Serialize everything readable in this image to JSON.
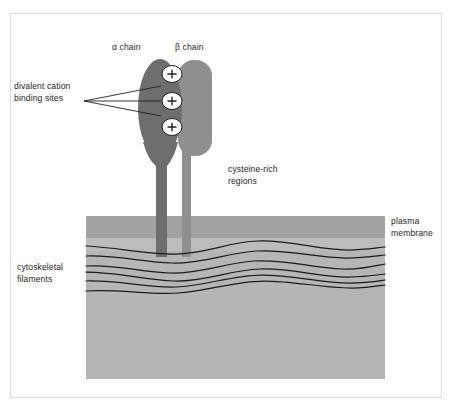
{
  "figure": {
    "frame_color": "#d8d8d8",
    "background": "#ffffff"
  },
  "labels": {
    "alpha_chain": "α chain",
    "beta_chain": "β chain",
    "divalent_cation": "divalent cation\nbinding sites",
    "cysteine_rich": "cysteine-rich\nregions",
    "plasma_membrane": "plasma\nmembrane",
    "cytoskeletal_filaments": "cytoskeletal\nfilaments"
  },
  "binding_sites": {
    "symbol": "+",
    "count": 3,
    "fill": "#ffffff",
    "stroke": "#231f20"
  },
  "colors": {
    "alpha_chain": "#6e6e6e",
    "beta_chain": "#8f8f8f",
    "alpha_stalk": "#6e6e6e",
    "beta_stalk": "#8f8f8f",
    "membrane_outer_band": "#a3a3a3",
    "membrane_inner_band": "#bcbcbc",
    "cytoplasm": "#b5b5b5",
    "filament_line": "#1a1a1a",
    "leader_line": "#231f20",
    "text": "#231f20"
  },
  "geometry": {
    "membrane_block": {
      "x": 86,
      "y": 216,
      "width": 299,
      "height": 163
    },
    "membrane_outer_band": {
      "y": 216,
      "height": 22
    },
    "membrane_inner_band": {
      "y": 238,
      "height": 13
    },
    "alpha_head": {
      "cx": 160,
      "cy": 110,
      "rx": 22,
      "ry": 50
    },
    "beta_head": {
      "x": 178,
      "y": 60,
      "width": 34,
      "height": 96,
      "radius": 16
    },
    "alpha_stalk": {
      "x": 156,
      "y": 150,
      "width": 11,
      "height": 107
    },
    "beta_stalk": {
      "x": 182,
      "y": 150,
      "width": 9,
      "height": 107
    },
    "binding_site_centers": [
      [
        172,
        74
      ],
      [
        172,
        101
      ],
      [
        172,
        127
      ]
    ],
    "leader_origin": [
      84,
      101
    ],
    "filament_count": 6
  }
}
